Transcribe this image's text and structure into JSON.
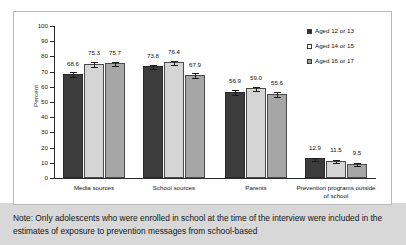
{
  "chart_data": {
    "type": "bar",
    "title": "",
    "subtitle": "",
    "xlabel": "",
    "ylabel": "Percent",
    "ylim": [
      0,
      100
    ],
    "ytick_step": 10,
    "yticks": [
      0,
      10,
      20,
      30,
      40,
      50,
      60,
      70,
      80,
      90,
      100
    ],
    "grid": false,
    "legend_position": "top-right",
    "categories": [
      "Media sources",
      "School sources",
      "Parents",
      "Prevention programs outside of school"
    ],
    "series": [
      {
        "name": "Aged 12 or 13",
        "color": "#3c3c3c",
        "values": [
          68.6,
          73.8,
          56.9,
          12.9
        ]
      },
      {
        "name": "Aged 14 or 15",
        "color": "#d5d5d5",
        "values": [
          75.3,
          76.4,
          59.0,
          11.5
        ]
      },
      {
        "name": "Aged 16 or 17",
        "color": "#a6a6a6",
        "values": [
          75.7,
          67.9,
          55.6,
          9.5
        ]
      }
    ],
    "error_bars": {
      "shown": true,
      "values": [
        [
          1.6,
          1.3,
          1.5,
          1.1
        ],
        [
          1.4,
          1.5,
          1.4,
          1.0
        ],
        [
          1.4,
          1.6,
          1.6,
          0.9
        ]
      ]
    },
    "value_labels": [
      [
        "68.6",
        "73.8",
        "56.9",
        "12.9"
      ],
      [
        "75.3",
        "76.4",
        "59.0",
        "11.5"
      ],
      [
        "75.7",
        "67.9",
        "55.6",
        "9.5"
      ]
    ]
  },
  "legend": {
    "items": [
      {
        "label": "Aged 12 or 13",
        "swatch": "filled-dark-square"
      },
      {
        "label": "Aged 14 or 15",
        "swatch": "open-light-square"
      },
      {
        "label": "Aged 16 or 17",
        "swatch": "hatched-gray-square"
      }
    ]
  },
  "axis": {
    "y_title": "Percent",
    "y_tick_labels": [
      "100",
      "90",
      "80",
      "70",
      "60",
      "50",
      "40",
      "30",
      "20",
      "10",
      "0"
    ]
  },
  "categories_display": [
    {
      "line1": "Media sources",
      "line2": ""
    },
    {
      "line1": "School sources",
      "line2": ""
    },
    {
      "line1": "Parents",
      "line2": ""
    },
    {
      "line1": "Prevention programs outside",
      "line2": "of school"
    }
  ],
  "note": {
    "text": "Note: Only adolescents who were enrolled in school at the time of the interview were included in the estimates of exposure to prevention messages from school-based"
  },
  "colors": {
    "series_1": "#3c3c3c",
    "series_2": "#d5d5d5",
    "series_3": "#a6a6a6",
    "axis": "#2b2b2b",
    "note_band": "#d8d8d8",
    "panel_border": "#b8b8b8"
  }
}
